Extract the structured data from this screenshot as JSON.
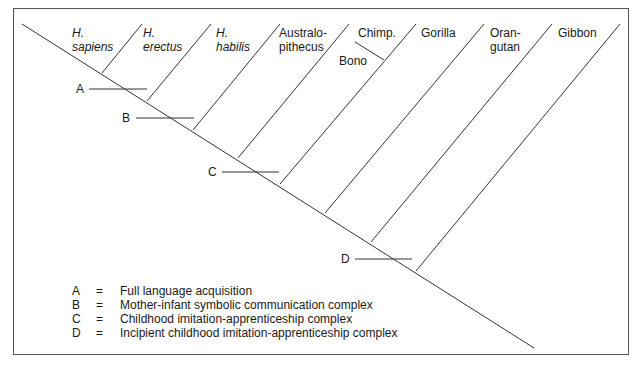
{
  "diagram": {
    "type": "cladogram",
    "line_color": "#333333",
    "taxa": [
      {
        "id": "h-sapiens",
        "line1": "H.",
        "line2": "sapiens",
        "italic": true
      },
      {
        "id": "h-erectus",
        "line1": "H.",
        "line2": "erectus",
        "italic": true
      },
      {
        "id": "h-habilis",
        "line1": "H.",
        "line2": "habilis",
        "italic": true
      },
      {
        "id": "australopithecus",
        "line1": "Australo-",
        "line2": "pithecus",
        "italic": false
      },
      {
        "id": "chimp",
        "line1": "Chimp.",
        "line2": "",
        "italic": false
      },
      {
        "id": "gorilla",
        "line1": "Gorilla",
        "line2": "",
        "italic": false
      },
      {
        "id": "orangutan",
        "line1": "Oran-",
        "line2": "gutan",
        "italic": false
      },
      {
        "id": "gibbon",
        "line1": "Gibbon",
        "line2": "",
        "italic": false
      }
    ],
    "sub_branch": {
      "label": "Bono",
      "parent": "chimp"
    },
    "markers": [
      {
        "key": "A",
        "description": "Full language acquisition"
      },
      {
        "key": "B",
        "description": "Mother-infant symbolic communication complex"
      },
      {
        "key": "C",
        "description": "Childhood imitation-apprenticeship complex"
      },
      {
        "key": "D",
        "description": "Incipient childhood imitation-apprenticeship complex"
      }
    ],
    "legend_separator": "="
  }
}
